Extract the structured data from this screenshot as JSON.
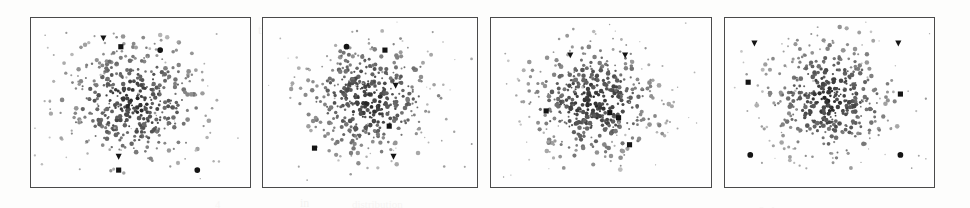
{
  "figure": {
    "title": "",
    "caption": "",
    "background_color": "#fdfdfc",
    "panel_border_color": "#4a4a4a",
    "panel_fill_color": "#fefefe",
    "cloud_dot_color": "#6b6b6b",
    "marker_color": "#141414",
    "panel_count": 4,
    "scan_artifacts": [
      {
        "text": "the",
        "x": 258,
        "y": 22,
        "size": 13,
        "opacity": 0.3
      },
      {
        "text": "of a",
        "x": 330,
        "y": 20,
        "size": 12,
        "opacity": 0.22
      },
      {
        "text": "in",
        "x": 300,
        "y": 196,
        "size": 12,
        "opacity": 0.25
      },
      {
        "text": "distribution",
        "x": 352,
        "y": 198,
        "size": 11,
        "opacity": 0.2
      },
      {
        "text": "0",
        "x": 520,
        "y": 36,
        "size": 15,
        "opacity": 0.28
      },
      {
        "text": "simu",
        "x": 560,
        "y": 33,
        "size": 13,
        "opacity": 0.2
      },
      {
        "text": "V.",
        "x": 660,
        "y": 32,
        "size": 14,
        "opacity": 0.26
      },
      {
        "text": "up",
        "x": 500,
        "y": 96,
        "size": 13,
        "opacity": 0.24
      },
      {
        "text": "in",
        "x": 560,
        "y": 95,
        "size": 12,
        "opacity": 0.2
      },
      {
        "text": "D",
        "x": 690,
        "y": 100,
        "size": 15,
        "opacity": 0.22
      },
      {
        "text": "sed",
        "x": 730,
        "y": 90,
        "size": 14,
        "opacity": 0.26
      },
      {
        "text": "c",
        "x": 780,
        "y": 92,
        "size": 13,
        "opacity": 0.2
      },
      {
        "text": "ru",
        "x": 700,
        "y": 146,
        "size": 13,
        "opacity": 0.22
      },
      {
        "text": "36",
        "x": 740,
        "y": 176,
        "size": 13,
        "opacity": 0.22
      },
      {
        "text": "6, 1",
        "x": 758,
        "y": 204,
        "size": 12,
        "opacity": 0.22
      },
      {
        "text": "s",
        "x": 906,
        "y": 204,
        "size": 12,
        "opacity": 0.2
      },
      {
        "text": "4",
        "x": 215,
        "y": 198,
        "size": 11,
        "opacity": 0.18
      }
    ]
  },
  "chart_data": [
    {
      "type": "scatter",
      "panel_index": 1,
      "panel_label": "",
      "title": "",
      "xlabel": "",
      "ylabel": "",
      "xlim": [
        0,
        100
      ],
      "ylim": [
        0,
        100
      ],
      "grid": false,
      "legend": "none",
      "frame": {
        "x": 30,
        "y": 17,
        "width": 221,
        "height": 171
      },
      "cloud": {
        "name": "background cloud",
        "point_count": 430,
        "center": [
          47,
          50
        ],
        "radius_x": 33,
        "radius_y": 36,
        "color": "#6b6b6b",
        "size_px": 1.6,
        "seed": 11
      },
      "series": [
        {
          "name": "down-triangle markers",
          "marker": "triangle-down",
          "color": "#141414",
          "points": [
            [
              33,
              88
            ],
            [
              40,
              18
            ]
          ]
        },
        {
          "name": "square markers",
          "marker": "square",
          "color": "#141414",
          "points": [
            [
              41,
              83
            ],
            [
              40,
              10
            ]
          ]
        },
        {
          "name": "circle markers",
          "marker": "circle",
          "color": "#141414",
          "points": [
            [
              59,
              81
            ],
            [
              76,
              10
            ]
          ]
        }
      ]
    },
    {
      "type": "scatter",
      "panel_index": 2,
      "panel_label": "",
      "title": "",
      "xlabel": "",
      "ylabel": "",
      "xlim": [
        0,
        100
      ],
      "ylim": [
        0,
        100
      ],
      "grid": false,
      "legend": "none",
      "frame": {
        "x": 262,
        "y": 17,
        "width": 216,
        "height": 171
      },
      "cloud": {
        "name": "background cloud",
        "point_count": 430,
        "center": [
          50,
          52
        ],
        "radius_x": 32,
        "radius_y": 35,
        "color": "#6b6b6b",
        "size_px": 1.6,
        "seed": 29
      },
      "series": [
        {
          "name": "down-triangle markers",
          "marker": "triangle-down",
          "color": "#141414",
          "points": [
            [
              62,
              60
            ],
            [
              61,
              18
            ]
          ]
        },
        {
          "name": "square markers",
          "marker": "square",
          "color": "#141414",
          "points": [
            [
              57,
              81
            ],
            [
              59,
              36
            ],
            [
              24,
              23
            ]
          ]
        },
        {
          "name": "circle markers",
          "marker": "circle",
          "color": "#141414",
          "points": [
            [
              39,
              83
            ]
          ]
        }
      ]
    },
    {
      "type": "scatter",
      "panel_index": 3,
      "panel_label": "",
      "title": "",
      "xlabel": "",
      "ylabel": "",
      "xlim": [
        0,
        100
      ],
      "ylim": [
        0,
        100
      ],
      "grid": false,
      "legend": "none",
      "frame": {
        "x": 490,
        "y": 17,
        "width": 222,
        "height": 171
      },
      "cloud": {
        "name": "background cloud",
        "point_count": 440,
        "center": [
          47,
          50
        ],
        "radius_x": 31,
        "radius_y": 36,
        "color": "#6b6b6b",
        "size_px": 1.6,
        "seed": 47
      },
      "series": [
        {
          "name": "down-triangle markers",
          "marker": "triangle-down",
          "color": "#141414",
          "points": [
            [
              36,
              78
            ],
            [
              61,
              78
            ]
          ]
        },
        {
          "name": "square markers",
          "marker": "square",
          "color": "#141414",
          "points": [
            [
              25,
              45
            ],
            [
              54,
              44
            ],
            [
              58,
              41
            ],
            [
              63,
              25
            ]
          ]
        },
        {
          "name": "circle markers",
          "marker": "circle",
          "color": "#141414",
          "points": []
        }
      ]
    },
    {
      "type": "scatter",
      "panel_index": 4,
      "panel_label": "",
      "title": "",
      "xlabel": "",
      "ylabel": "",
      "xlim": [
        0,
        100
      ],
      "ylim": [
        0,
        100
      ],
      "grid": false,
      "legend": "none",
      "frame": {
        "x": 724,
        "y": 17,
        "width": 211,
        "height": 171
      },
      "cloud": {
        "name": "background cloud",
        "point_count": 420,
        "center": [
          50,
          52
        ],
        "radius_x": 30,
        "radius_y": 37,
        "color": "#6b6b6b",
        "size_px": 1.6,
        "seed": 71
      },
      "series": [
        {
          "name": "down-triangle markers",
          "marker": "triangle-down",
          "color": "#141414",
          "points": [
            [
              14,
              85
            ],
            [
              83,
              85
            ]
          ]
        },
        {
          "name": "square markers",
          "marker": "square",
          "color": "#141414",
          "points": [
            [
              11,
              62
            ],
            [
              84,
              55
            ]
          ]
        },
        {
          "name": "circle markers",
          "marker": "circle",
          "color": "#141414",
          "points": [
            [
              12,
              19
            ],
            [
              84,
              19
            ]
          ]
        }
      ]
    }
  ]
}
